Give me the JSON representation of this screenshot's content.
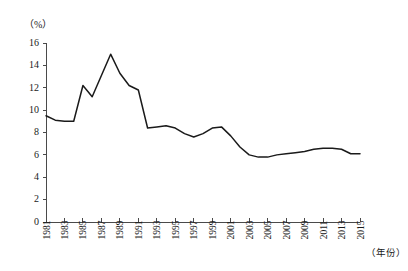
{
  "chart_data": {
    "type": "line",
    "title": "",
    "subtitle": "",
    "xlabel": "（年份）",
    "ylabel": "（%）",
    "ylim": [
      0,
      16
    ],
    "xlim": [
      1981,
      2015
    ],
    "ytick_labels": [
      "0",
      "2",
      "4",
      "6",
      "8",
      "10",
      "12",
      "14",
      "16"
    ],
    "ytick_values": [
      0,
      2,
      4,
      6,
      8,
      10,
      12,
      14,
      16
    ],
    "xtick_labels": [
      "1981",
      "1983",
      "1985",
      "1987",
      "1989",
      "1991",
      "1993",
      "1995",
      "1997",
      "1999",
      "2001",
      "2003",
      "2005",
      "2007",
      "2009",
      "2011",
      "2013",
      "2015"
    ],
    "xtick_values": [
      1981,
      1983,
      1985,
      1987,
      1989,
      1991,
      1993,
      1995,
      1997,
      1999,
      2001,
      2003,
      2005,
      2007,
      2009,
      2011,
      2013,
      2015
    ],
    "grid": false,
    "legend": false,
    "legend_position": "none",
    "line_color": "#1a1a1a",
    "axis_color": "#4a4a4a",
    "background_color": "#ffffff",
    "x": [
      1981,
      1982,
      1983,
      1984,
      1985,
      1986,
      1987,
      1988,
      1989,
      1990,
      1991,
      1992,
      1993,
      1994,
      1995,
      1996,
      1997,
      1998,
      1999,
      2000,
      2001,
      2002,
      2003,
      2004,
      2005,
      2006,
      2007,
      2008,
      2009,
      2010,
      2011,
      2012,
      2013,
      2014,
      2015
    ],
    "values": [
      9.5,
      9.1,
      9.0,
      9.0,
      12.2,
      11.2,
      13.1,
      15.0,
      13.3,
      12.2,
      11.8,
      8.4,
      8.5,
      8.6,
      8.4,
      7.9,
      7.6,
      7.9,
      8.4,
      8.5,
      7.7,
      6.7,
      6.0,
      5.8,
      5.8,
      6.0,
      6.1,
      6.2,
      6.3,
      6.5,
      6.6,
      6.6,
      6.5,
      6.1,
      6.1
    ],
    "series": [
      {
        "name": "",
        "values": [
          9.5,
          9.1,
          9.0,
          9.0,
          12.2,
          11.2,
          13.1,
          15.0,
          13.3,
          12.2,
          11.8,
          8.4,
          8.5,
          8.6,
          8.4,
          7.9,
          7.6,
          7.9,
          8.4,
          8.5,
          7.7,
          6.7,
          6.0,
          5.8,
          5.8,
          6.0,
          6.1,
          6.2,
          6.3,
          6.5,
          6.6,
          6.6,
          6.5,
          6.1,
          6.1
        ]
      }
    ]
  },
  "layout": {
    "plot_left": 46,
    "plot_right": 360,
    "plot_top": 43,
    "plot_bottom": 222
  }
}
